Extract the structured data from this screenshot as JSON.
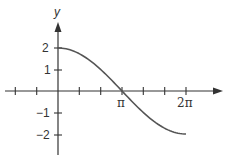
{
  "chart_data": {
    "type": "line",
    "title": "",
    "xlabel": "",
    "ylabel": "y",
    "function": "y = 2cos(x/2)",
    "x_range": [
      0,
      6.2832
    ],
    "xlim": [
      -2.094,
      6.9
    ],
    "ylim": [
      -2.6,
      3.0
    ],
    "x_tick_labels": [
      {
        "value": 3.1416,
        "label": "π"
      },
      {
        "value": 6.2832,
        "label": "2π"
      }
    ],
    "x_tick_step": "π/3",
    "y_ticks": [
      {
        "value": 2,
        "label": "2"
      },
      {
        "value": 1,
        "label": "1"
      },
      {
        "value": -1,
        "label": "−1"
      },
      {
        "value": -2,
        "label": "−2"
      }
    ],
    "x": [
      0,
      0.5236,
      1.0472,
      1.5708,
      2.0944,
      2.618,
      3.1416,
      3.6652,
      4.1888,
      4.7124,
      5.236,
      5.7596,
      6.2832
    ],
    "y": [
      2,
      1.932,
      1.732,
      1.414,
      1.0,
      0.518,
      0,
      -0.518,
      -1.0,
      -1.414,
      -1.732,
      -1.932,
      -2
    ],
    "grid": false,
    "color": "#555555"
  }
}
